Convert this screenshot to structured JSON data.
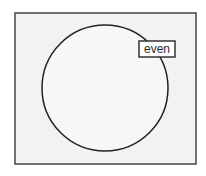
{
  "diagram": {
    "type": "venn",
    "universe": {
      "x": 15,
      "y": 13,
      "width": 181,
      "height": 151,
      "fill": "#f2f2f2",
      "stroke": "#444444"
    },
    "sets": [
      {
        "label": "even",
        "cx": 105,
        "cy": 88,
        "r": 63,
        "fill": "#f7f7f7",
        "stroke": "#222222"
      }
    ]
  }
}
